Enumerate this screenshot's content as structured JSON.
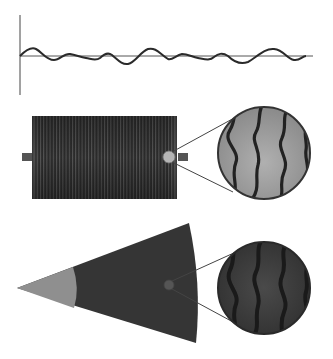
{
  "figure": {
    "panels": [
      {
        "id": "waveform",
        "description": "Waveform signal plotted on horizontal baseline with vertical axis"
      },
      {
        "id": "coil",
        "description": "Cylindrical coil with striped windings, two terminal tabs, and magnified circular inset showing wavy fibers"
      },
      {
        "id": "fan",
        "description": "Cone/fan sector with lighter tip region and magnified circular inset showing wavy fibers"
      }
    ],
    "colors": {
      "background": "#ffffff",
      "axis": "#444444",
      "wave": "#2a2a2a",
      "coil_dark": "#2b2b2b",
      "coil_stripe": "#6a6a6a",
      "tab": "#555555",
      "inset_light": "#a8a8a8",
      "inset_dark_fill": "#3a3a3a",
      "fiber": "#222222",
      "fan_dark": "#353535",
      "fan_tip": "#8f8f8f",
      "marker_light": "#b5b5b5",
      "marker_dark": "#555555"
    }
  }
}
